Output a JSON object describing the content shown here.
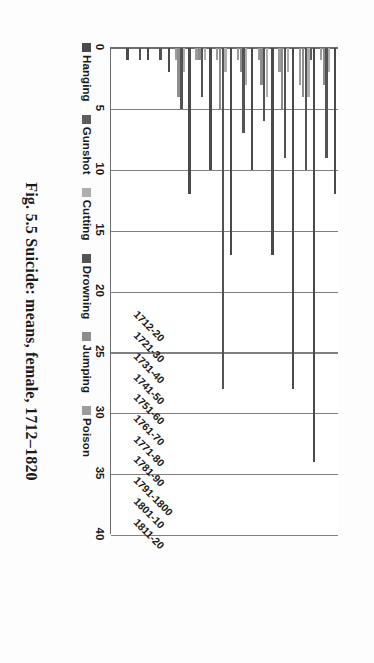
{
  "figure": {
    "caption": "Fig. 5.5 Suicide: means, female, 1712–1820"
  },
  "legend": {
    "position": "top-right",
    "items": [
      {
        "label": "Hanging",
        "color": "#4a4a4a"
      },
      {
        "label": "Gunshot",
        "color": "#5d5d5d"
      },
      {
        "label": "Cutting",
        "color": "#aeaeae"
      },
      {
        "label": "Drowning",
        "color": "#535353"
      },
      {
        "label": "Jumping",
        "color": "#8d8d8d"
      },
      {
        "label": "Poison",
        "color": "#9b9b9b"
      }
    ]
  },
  "axes": {
    "value_ticks": [
      "0",
      "5",
      "10",
      "15",
      "20",
      "25",
      "30",
      "35",
      "40"
    ],
    "value_min": 0,
    "value_max": 40,
    "grid": true
  },
  "chart_data": {
    "type": "bar",
    "orientation": "horizontal",
    "title": "Fig. 5.5 Suicide: means, female, 1712–1820",
    "xlabel": "",
    "ylabel": "",
    "xlim": [
      0,
      40
    ],
    "grid": true,
    "legend_position": "top-right",
    "categories": [
      "1712-20",
      "1721-30",
      "1731-40",
      "1741-50",
      "1751-60",
      "1761-70",
      "1771-80",
      "1781-90",
      "1791-1800",
      "1801-10",
      "1811-20"
    ],
    "series": [
      {
        "name": "Hanging",
        "color": "#4a4a4a",
        "values": [
          1,
          1,
          2,
          12,
          10,
          17,
          10,
          17,
          28,
          34,
          12
        ]
      },
      {
        "name": "Gunshot",
        "color": "#5d5d5d",
        "values": [
          0,
          0,
          0,
          0,
          0,
          0,
          0,
          0,
          0,
          1,
          0
        ]
      },
      {
        "name": "Cutting",
        "color": "#aeaeae",
        "values": [
          0,
          0,
          0,
          2,
          1,
          2,
          3,
          4,
          2,
          4,
          2
        ]
      },
      {
        "name": "Drowning",
        "color": "#535353",
        "values": [
          0,
          1,
          1,
          5,
          4,
          28,
          7,
          6,
          9,
          10,
          9
        ]
      },
      {
        "name": "Jumping",
        "color": "#8d8d8d",
        "values": [
          0,
          0,
          0,
          4,
          1,
          5,
          2,
          3,
          5,
          4,
          3
        ]
      },
      {
        "name": "Poison",
        "color": "#9b9b9b",
        "values": [
          0,
          0,
          0,
          1,
          1,
          1,
          1,
          1,
          2,
          3,
          1
        ]
      }
    ]
  }
}
